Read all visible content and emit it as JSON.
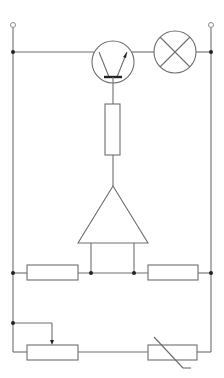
{
  "diagram": {
    "type": "circuit-schematic",
    "colors": {
      "wire": "#6e6e6e",
      "junction": "#222222",
      "background": "#ffffff"
    },
    "components": [
      {
        "id": "terminal-left",
        "kind": "terminal"
      },
      {
        "id": "terminal-right",
        "kind": "terminal"
      },
      {
        "id": "transistor",
        "kind": "npn-transistor"
      },
      {
        "id": "lamp",
        "kind": "lamp"
      },
      {
        "id": "base-resistor",
        "kind": "resistor"
      },
      {
        "id": "op-amp",
        "kind": "comparator"
      },
      {
        "id": "resistor-left",
        "kind": "resistor"
      },
      {
        "id": "resistor-right",
        "kind": "resistor"
      },
      {
        "id": "potentiometer",
        "kind": "variable-resistor"
      },
      {
        "id": "thermistor",
        "kind": "thermistor"
      }
    ]
  }
}
